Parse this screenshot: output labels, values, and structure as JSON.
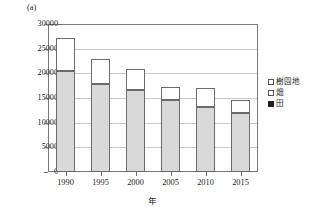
{
  "chart_data": {
    "type": "bar",
    "stacked": true,
    "title": "",
    "subtitle": "",
    "unit_label": "(a)",
    "xlabel": "年",
    "ylabel": "",
    "categories": [
      "1990",
      "1995",
      "2000",
      "2005",
      "2010",
      "2015"
    ],
    "ylim": [
      0,
      30000
    ],
    "ytick_step": 5000,
    "yticks": [
      "0",
      "5000",
      "10000",
      "15000",
      "20000",
      "25000",
      "30000"
    ],
    "grid": true,
    "legend_position": "right",
    "series": [
      {
        "name": "樹園地",
        "color": "#ffffff",
        "values": [
          6700,
          5100,
          4300,
          2800,
          3800,
          2600
        ]
      },
      {
        "name": "畑",
        "color": "#d9d9d9",
        "values": [
          20400,
          17800,
          16600,
          14500,
          13200,
          11900
        ]
      },
      {
        "name": "田",
        "color": "#1e1e1e",
        "values": [
          0,
          0,
          0,
          0,
          0,
          0
        ]
      }
    ],
    "totals": [
      27100,
      22900,
      20900,
      17300,
      17000,
      14500
    ]
  },
  "legend": {
    "items": [
      {
        "label": "樹園地",
        "swatch": "open-square-swatch"
      },
      {
        "label": "畑",
        "swatch": "open-square-swatch"
      },
      {
        "label": "田",
        "swatch": "filled-square-swatch"
      }
    ]
  }
}
